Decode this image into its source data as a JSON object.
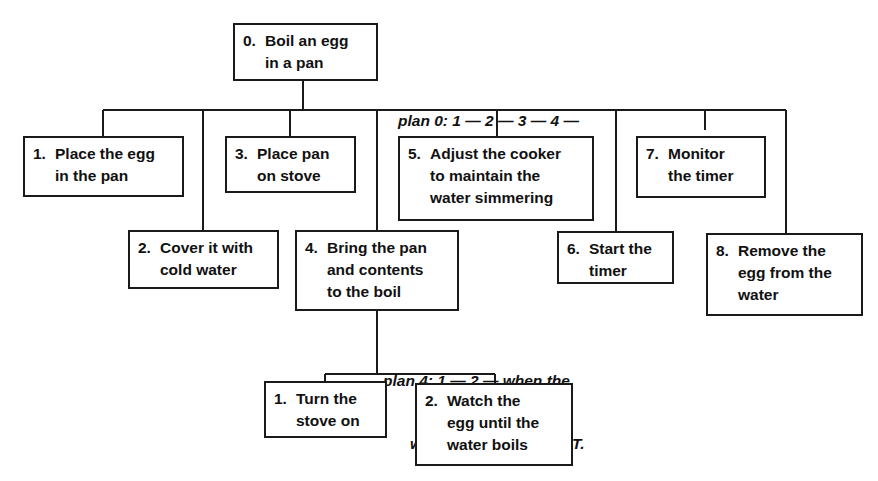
{
  "diagram": {
    "type": "hierarchical-task-analysis",
    "root": {
      "id": "0",
      "number": "0.",
      "label": "Boil an egg\nin a pan"
    },
    "plan0": {
      "line1": "plan 0: 1 — 2 — 3 — 4 —",
      "line2": "5 — 6 — 7 — 8."
    },
    "tasks": [
      {
        "id": "1",
        "number": "1.",
        "label": "Place the egg\nin the pan"
      },
      {
        "id": "2",
        "number": "2.",
        "label": "Cover it with\ncold water"
      },
      {
        "id": "3",
        "number": "3.",
        "label": "Place pan\non stove"
      },
      {
        "id": "4",
        "number": "4.",
        "label": "Bring the pan\nand contents\nto the boil"
      },
      {
        "id": "5",
        "number": "5.",
        "label": "Adjust the cooker\nto maintain the\nwater simmering"
      },
      {
        "id": "6",
        "number": "6.",
        "label": "Start the\ntimer"
      },
      {
        "id": "7",
        "number": "7.",
        "label": "Monitor\nthe timer"
      },
      {
        "id": "8",
        "number": "8.",
        "label": "Remove the\negg from the\nwater"
      }
    ],
    "plan4": {
      "line1": "plan 4: 1 — 2 — when the",
      "line2": "water is boiling — EXIT."
    },
    "subtasks4": [
      {
        "id": "4.1",
        "number": "1.",
        "label": "Turn the\nstove on"
      },
      {
        "id": "4.2",
        "number": "2.",
        "label": "Watch the\negg until the\nwater boils"
      }
    ],
    "colors": {
      "line": "#1a1a1a",
      "background": "#ffffff",
      "text": "#111111"
    }
  }
}
